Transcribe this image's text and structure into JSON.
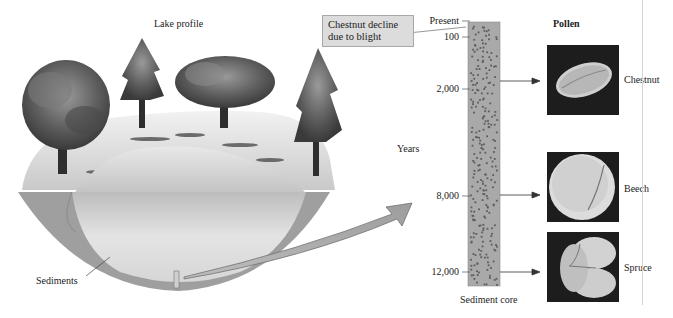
{
  "lake": {
    "title": "Lake profile",
    "sediments_label": "Sediments"
  },
  "core": {
    "axis_title": "Years",
    "caption": "Sediment core",
    "ticks": [
      {
        "label": "Present",
        "y": 21
      },
      {
        "label": "100",
        "y": 37
      },
      {
        "label": "2,000",
        "y": 89
      },
      {
        "label": "8,000",
        "y": 196
      },
      {
        "label": "12,000",
        "y": 272
      }
    ],
    "fill_color": "#a9a9a9",
    "dot_color": "#5c5c5c"
  },
  "callout": {
    "text_line1": "Chestnut decline",
    "text_line2": "due to blight"
  },
  "pollen": {
    "title": "Pollen",
    "items": [
      {
        "name": "Chestnut",
        "age": "2,000"
      },
      {
        "name": "Beech",
        "age": "8,000"
      },
      {
        "name": "Spruce",
        "age": "12,000"
      }
    ]
  }
}
